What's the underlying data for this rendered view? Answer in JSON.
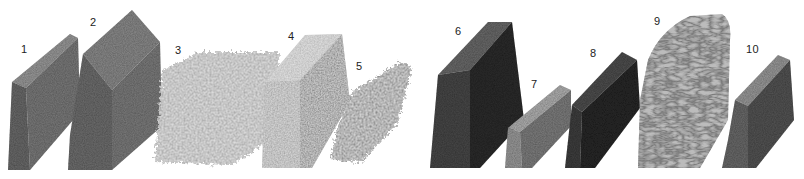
{
  "figure": {
    "type": "rendered 3D sample blocks",
    "background": "#ffffff",
    "samples": [
      {
        "label": "1",
        "shape": "slab",
        "texture": "fine fibrous",
        "tone": "#6e6e6e",
        "label_pos": [
          23,
          52
        ]
      },
      {
        "label": "2",
        "shape": "block",
        "texture": "fibrous dense",
        "tone": "#707070",
        "label_pos": [
          91,
          22
        ]
      },
      {
        "label": "3",
        "shape": "diffuse slab",
        "texture": "fuzzy granular",
        "tone": "#9a9a9a",
        "label_pos": [
          176,
          50
        ]
      },
      {
        "label": "4",
        "shape": "slab",
        "texture": "bubbly porous",
        "tone": "#8c8c8c",
        "label_pos": [
          288,
          37
        ]
      },
      {
        "label": "5",
        "shape": "diffuse slab",
        "texture": "branched granular",
        "tone": "#7c7c7c",
        "label_pos": [
          355,
          66
        ]
      },
      {
        "label": "6",
        "shape": "tall block",
        "texture": "dense granular",
        "tone": "#3c3c3c",
        "label_pos": [
          455,
          30
        ]
      },
      {
        "label": "7",
        "shape": "low slab",
        "texture": "fine granular",
        "tone": "#8a8a8a",
        "label_pos": [
          531,
          83
        ]
      },
      {
        "label": "8",
        "shape": "block",
        "texture": "dense granular",
        "tone": "#383838",
        "label_pos": [
          591,
          53
        ]
      },
      {
        "label": "9",
        "shape": "rounded block",
        "texture": "labyrinthine ridges",
        "tone": "#a8a8a8",
        "label_pos": [
          655,
          19
        ]
      },
      {
        "label": "10",
        "shape": "slab",
        "texture": "fine granular",
        "tone": "#5e5e5e",
        "label_pos": [
          747,
          47
        ]
      }
    ]
  }
}
